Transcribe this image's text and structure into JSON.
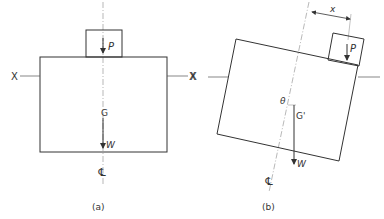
{
  "diagram_a": {
    "caption": "(a)",
    "axis_left_label": "X",
    "axis_right_label": "X",
    "load_label": "P",
    "cg_label": "G",
    "weight_label": "W",
    "centerline_symbol": "℄"
  },
  "diagram_b": {
    "caption": "(b)",
    "axis_left_label": "X",
    "load_label": "P",
    "cg_label": "G'",
    "weight_label": "W",
    "angle_label": "θ",
    "offset_label": "x",
    "centerline_symbol": "℄"
  },
  "colors": {
    "line": "#333333",
    "centerline": "#999999",
    "background": "#ffffff"
  }
}
